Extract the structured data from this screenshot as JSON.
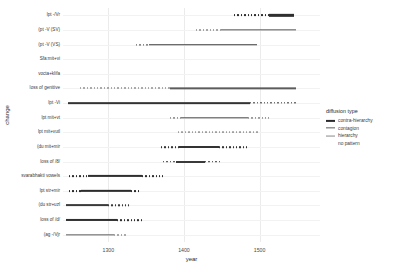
{
  "chart_data": {
    "type": "line",
    "title": "",
    "xlabel": "year",
    "ylabel": "change",
    "xlim": [
      1240,
      1580
    ],
    "grid": true,
    "legend_position": "right",
    "xticks": [
      1300,
      1400,
      1500
    ],
    "xtick_labels": [
      "1300",
      "1400",
      "1500"
    ],
    "categories": [
      "lpt -/Vr",
      "(pt -V (SV)",
      "(pt -V (VS)",
      "Sfa:mit+vi",
      "vocta+klifa",
      "loss of genitive",
      "lpt -Vi",
      "lpt mit+vt",
      "lpt mit+vutl",
      "(du mit+mir",
      "loss of /8/",
      "svarabhakti vowels",
      "lpt str+mir",
      "(du str+uzl",
      "loss of /d/",
      "(ag -/Vjr"
    ],
    "series": [
      {
        "name": "lpt -/Vr",
        "diffusion_type": "contra-hierarchy",
        "dotted_start": 1466,
        "dotted_end": 1513,
        "solid_start": 1513,
        "solid_end": 1545,
        "weight": 2.3,
        "color": "#2f2f2f"
      },
      {
        "name": "(pt -V (SV)",
        "diffusion_type": "contagion",
        "dotted_start": 1416,
        "dotted_end": 1449,
        "solid_start": 1449,
        "solid_end": 1548,
        "weight": 1.3,
        "color": "#545454"
      },
      {
        "name": "(pt -V (VS)",
        "diffusion_type": "contagion",
        "dotted_start": 1337,
        "dotted_end": 1354,
        "solid_start": 1354,
        "solid_end": 1497,
        "weight": 1.5,
        "color": "#3d3d3d"
      },
      {
        "name": "Sfa:mit+vi",
        "diffusion_type": "no pattern",
        "dotted_start": null,
        "dotted_end": null,
        "solid_start": null,
        "solid_end": null,
        "weight": 0,
        "color": "#9a9a9a"
      },
      {
        "name": "vocta+klifa",
        "diffusion_type": "no pattern",
        "dotted_start": null,
        "dotted_end": null,
        "solid_start": null,
        "solid_end": null,
        "weight": 0,
        "color": "#9a9a9a"
      },
      {
        "name": "loss of genitive",
        "diffusion_type": "contagion",
        "dotted_start": 1262,
        "dotted_end": 1381,
        "solid_start": 1381,
        "solid_end": 1548,
        "weight": 1.3,
        "color": "#5c5c5c"
      },
      {
        "name": "lpt -Vi",
        "diffusion_type": "hierarchy",
        "dotted_start": 1487,
        "dotted_end": 1548,
        "solid_start": 1246,
        "solid_end": 1487,
        "weight": 1.7,
        "color": "#333333"
      },
      {
        "name": "lpt mit+vt",
        "diffusion_type": "contagion",
        "dotted_start": 1381,
        "dotted_end": 1396,
        "solid_start": 1396,
        "solid_end": 1485,
        "weight": 1.4,
        "color": "#4a4a4a",
        "dotted_tail_start": 1485,
        "dotted_tail_end": 1513
      },
      {
        "name": "lpt mit+vutl",
        "diffusion_type": "no pattern",
        "dotted_start": 1392,
        "dotted_end": 1500,
        "solid_start": null,
        "solid_end": null,
        "weight": 1.0,
        "color": "#5c5c5c"
      },
      {
        "name": "(du mit+mir",
        "diffusion_type": "contra-hierarchy",
        "dotted_start": 1370,
        "dotted_end": 1393,
        "solid_start": 1393,
        "solid_end": 1446,
        "weight": 2.0,
        "color": "#333333",
        "dotted_tail_start": 1446,
        "dotted_tail_end": 1483
      },
      {
        "name": "loss of /8/",
        "diffusion_type": "contra-hierarchy",
        "dotted_start": 1372,
        "dotted_end": 1389,
        "solid_start": 1389,
        "solid_end": 1428,
        "weight": 2.0,
        "color": "#3a3a3a",
        "dotted_tail_start": 1428,
        "dotted_tail_end": 1448
      },
      {
        "name": "svarabhakti vowels",
        "diffusion_type": "contra-hierarchy",
        "dotted_start": 1248,
        "dotted_end": 1273,
        "solid_start": 1273,
        "solid_end": 1344,
        "weight": 2.2,
        "color": "#2f2f2f",
        "dotted_tail_start": 1344,
        "dotted_tail_end": 1372
      },
      {
        "name": "lpt str+mir",
        "diffusion_type": "contra-hierarchy",
        "dotted_start": 1248,
        "dotted_end": 1264,
        "solid_start": 1264,
        "solid_end": 1330,
        "weight": 2.3,
        "color": "#2b2b2b",
        "dotted_tail_start": 1330,
        "dotted_tail_end": 1342
      },
      {
        "name": "(du str+uzl",
        "diffusion_type": "hierarchy",
        "dotted_start": 1300,
        "dotted_end": 1327,
        "solid_start": 1244,
        "solid_end": 1300,
        "weight": 1.8,
        "color": "#3a3a3a"
      },
      {
        "name": "loss of /d/",
        "diffusion_type": "contra-hierarchy",
        "dotted_start": 1311,
        "dotted_end": 1345,
        "solid_start": 1244,
        "solid_end": 1311,
        "weight": 2.1,
        "color": "#2f2f2f"
      },
      {
        "name": "(ag -/Vjr",
        "diffusion_type": "contagion",
        "dotted_start": 1308,
        "dotted_end": 1325,
        "solid_start": 1244,
        "solid_end": 1308,
        "weight": 1.3,
        "color": "#5c5c5c"
      }
    ]
  },
  "legend": {
    "title": "diffusion type",
    "items": [
      {
        "label": "contra-hierarchy",
        "color": "#2b2b2b",
        "weight": 2.2
      },
      {
        "label": "contagion",
        "color": "#5c5c5c",
        "weight": 1.3
      },
      {
        "label": "hierarchy",
        "color": "#8a8a8a",
        "weight": 0.9
      },
      {
        "label": "no pattern",
        "color": "#ffffff",
        "weight": 0
      }
    ]
  }
}
